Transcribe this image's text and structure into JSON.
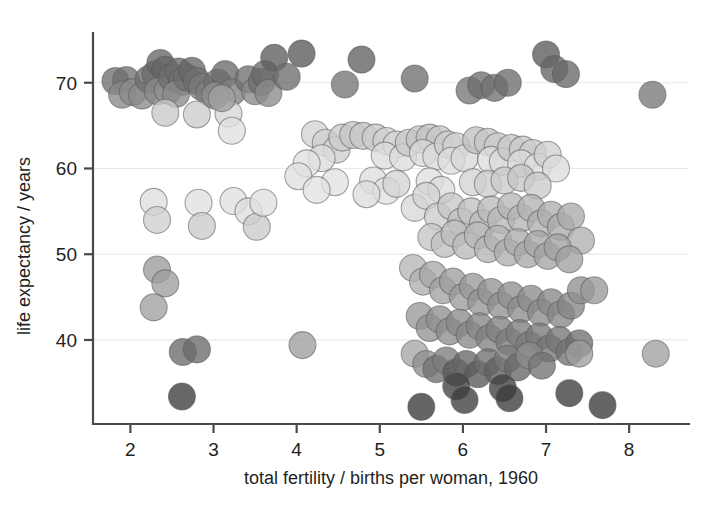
{
  "chart_data": {
    "type": "scatter",
    "title": "",
    "xlabel": "total fertility / births per woman, 1960",
    "ylabel": "life expectancy / years",
    "xlim": [
      1.55,
      8.72
    ],
    "ylim": [
      30.2,
      75.8
    ],
    "xticks": [
      2,
      3,
      4,
      5,
      6,
      7,
      8
    ],
    "xticklabels": [
      "2",
      "3",
      "4",
      "5",
      "6",
      "7",
      "8"
    ],
    "yticks": [
      40,
      50,
      60,
      70
    ],
    "yticklabels": [
      "40",
      "50",
      "60",
      "70"
    ],
    "grid": "horizontal",
    "legend": "none",
    "marker": {
      "shape": "circle",
      "diameter_px": 27,
      "opacity": 0.78,
      "edge_color": "#5a5a5a"
    },
    "encoding": {
      "x": "total fertility (births per woman), 1960",
      "y": "life expectancy (years)",
      "color": "grayscale shade per point (darker = higher income group)"
    },
    "shades": {
      "very_dark": "#3a3a3a",
      "dark": "#6b6b6b",
      "mid": "#9a9a9a",
      "light": "#c3c3c3",
      "very_light": "#e2e2e2"
    },
    "points": [
      {
        "x": 1.82,
        "y": 70.2,
        "c": "#6f6f6f"
      },
      {
        "x": 1.95,
        "y": 70.3,
        "c": "#6f6f6f"
      },
      {
        "x": 1.9,
        "y": 68.6,
        "c": "#888888"
      },
      {
        "x": 2.03,
        "y": 68.9,
        "c": "#8a8a8a"
      },
      {
        "x": 2.14,
        "y": 68.5,
        "c": "#8a8a8a"
      },
      {
        "x": 2.22,
        "y": 70.4,
        "c": "#6f6f6f"
      },
      {
        "x": 2.3,
        "y": 71.0,
        "c": "#6b6b6b"
      },
      {
        "x": 2.36,
        "y": 72.3,
        "c": "#666666"
      },
      {
        "x": 2.42,
        "y": 71.5,
        "c": "#666666"
      },
      {
        "x": 2.33,
        "y": 69.0,
        "c": "#888888"
      },
      {
        "x": 2.45,
        "y": 69.1,
        "c": "#8a8a8a"
      },
      {
        "x": 2.5,
        "y": 70.6,
        "c": "#6f6f6f"
      },
      {
        "x": 2.58,
        "y": 71.3,
        "c": "#6a6a6a"
      },
      {
        "x": 2.62,
        "y": 70.1,
        "c": "#6f6f6f"
      },
      {
        "x": 2.55,
        "y": 68.7,
        "c": "#8a8a8a"
      },
      {
        "x": 2.68,
        "y": 70.6,
        "c": "#6f6f6f"
      },
      {
        "x": 2.74,
        "y": 71.4,
        "c": "#676767"
      },
      {
        "x": 2.8,
        "y": 70.2,
        "c": "#6f6f6f"
      },
      {
        "x": 2.86,
        "y": 69.5,
        "c": "#7a7a7a"
      },
      {
        "x": 2.95,
        "y": 68.8,
        "c": "#7c7c7c"
      },
      {
        "x": 3.05,
        "y": 70.0,
        "c": "#6f6f6f"
      },
      {
        "x": 3.14,
        "y": 71.0,
        "c": "#6a6a6a"
      },
      {
        "x": 3.22,
        "y": 68.9,
        "c": "#828282"
      },
      {
        "x": 3.42,
        "y": 70.4,
        "c": "#6f6f6f"
      },
      {
        "x": 3.5,
        "y": 69.0,
        "c": "#898989"
      },
      {
        "x": 3.58,
        "y": 70.1,
        "c": "#6f6f6f"
      },
      {
        "x": 3.62,
        "y": 71.0,
        "c": "#6a6a6a"
      },
      {
        "x": 3.66,
        "y": 68.8,
        "c": "#8a8a8a"
      },
      {
        "x": 3.73,
        "y": 72.9,
        "c": "#5e5e5e"
      },
      {
        "x": 3.88,
        "y": 70.7,
        "c": "#6d6d6d"
      },
      {
        "x": 4.06,
        "y": 73.4,
        "c": "#5a5a5a"
      },
      {
        "x": 4.58,
        "y": 69.8,
        "c": "#747474"
      },
      {
        "x": 4.78,
        "y": 72.7,
        "c": "#616161"
      },
      {
        "x": 5.42,
        "y": 70.5,
        "c": "#6e6e6e"
      },
      {
        "x": 6.08,
        "y": 69.1,
        "c": "#767676"
      },
      {
        "x": 6.22,
        "y": 69.7,
        "c": "#6e6e6e"
      },
      {
        "x": 6.38,
        "y": 69.4,
        "c": "#717171"
      },
      {
        "x": 6.54,
        "y": 70.0,
        "c": "#6c6c6c"
      },
      {
        "x": 7.0,
        "y": 73.3,
        "c": "#5b5b5b"
      },
      {
        "x": 7.1,
        "y": 71.6,
        "c": "#646464"
      },
      {
        "x": 7.24,
        "y": 71.0,
        "c": "#686868"
      },
      {
        "x": 8.28,
        "y": 68.6,
        "c": "#787878"
      },
      {
        "x": 2.42,
        "y": 66.5,
        "c": "#c8c8c8"
      },
      {
        "x": 2.8,
        "y": 66.3,
        "c": "#cccccc"
      },
      {
        "x": 3.18,
        "y": 66.4,
        "c": "#d6d6d6"
      },
      {
        "x": 3.22,
        "y": 64.4,
        "c": "#e0e0e0"
      },
      {
        "x": 3.02,
        "y": 68.5,
        "c": "#909090"
      },
      {
        "x": 3.1,
        "y": 68.2,
        "c": "#a0a0a0"
      },
      {
        "x": 4.22,
        "y": 64.0,
        "c": "#d4d4d4"
      },
      {
        "x": 4.35,
        "y": 63.0,
        "c": "#cfcfcf"
      },
      {
        "x": 4.48,
        "y": 62.2,
        "c": "#cfcfcf"
      },
      {
        "x": 4.3,
        "y": 61.2,
        "c": "#dddddd"
      },
      {
        "x": 4.12,
        "y": 60.6,
        "c": "#e0e0e0"
      },
      {
        "x": 4.55,
        "y": 63.6,
        "c": "#cccccc"
      },
      {
        "x": 4.68,
        "y": 63.9,
        "c": "#c6c6c6"
      },
      {
        "x": 4.8,
        "y": 63.8,
        "c": "#c8c8c8"
      },
      {
        "x": 4.95,
        "y": 63.6,
        "c": "#cacaca"
      },
      {
        "x": 5.08,
        "y": 63.2,
        "c": "#cfcfcf"
      },
      {
        "x": 5.2,
        "y": 62.8,
        "c": "#d3d3d3"
      },
      {
        "x": 5.06,
        "y": 61.5,
        "c": "#dddddd"
      },
      {
        "x": 5.28,
        "y": 61.3,
        "c": "#dddddd"
      },
      {
        "x": 5.35,
        "y": 63.0,
        "c": "#c9c9c9"
      },
      {
        "x": 5.48,
        "y": 63.4,
        "c": "#c4c4c4"
      },
      {
        "x": 5.6,
        "y": 63.6,
        "c": "#c1c1c1"
      },
      {
        "x": 5.72,
        "y": 63.4,
        "c": "#c6c6c6"
      },
      {
        "x": 5.52,
        "y": 61.8,
        "c": "#d9d9d9"
      },
      {
        "x": 5.68,
        "y": 61.4,
        "c": "#dadada"
      },
      {
        "x": 5.82,
        "y": 62.8,
        "c": "#cdcdcd"
      },
      {
        "x": 5.92,
        "y": 62.6,
        "c": "#cfcfcf"
      },
      {
        "x": 5.86,
        "y": 60.9,
        "c": "#dedede"
      },
      {
        "x": 6.02,
        "y": 61.2,
        "c": "#d9d9d9"
      },
      {
        "x": 6.16,
        "y": 63.3,
        "c": "#c0c0c0"
      },
      {
        "x": 6.3,
        "y": 63.1,
        "c": "#c5c5c5"
      },
      {
        "x": 6.42,
        "y": 62.6,
        "c": "#cacaca"
      },
      {
        "x": 6.34,
        "y": 61.0,
        "c": "#dcdcdc"
      },
      {
        "x": 6.48,
        "y": 60.8,
        "c": "#dbdbdb"
      },
      {
        "x": 6.58,
        "y": 62.4,
        "c": "#c8c8c8"
      },
      {
        "x": 6.72,
        "y": 62.2,
        "c": "#c9c9c9"
      },
      {
        "x": 6.84,
        "y": 61.8,
        "c": "#cbcbcb"
      },
      {
        "x": 6.7,
        "y": 60.6,
        "c": "#dddddd"
      },
      {
        "x": 6.9,
        "y": 60.2,
        "c": "#dededeff"
      },
      {
        "x": 7.02,
        "y": 61.6,
        "c": "#cfcfcf"
      },
      {
        "x": 7.12,
        "y": 60.0,
        "c": "#dddddd"
      },
      {
        "x": 4.02,
        "y": 59.1,
        "c": "#e0e0e0"
      },
      {
        "x": 4.46,
        "y": 58.4,
        "c": "#e2e2e2"
      },
      {
        "x": 4.92,
        "y": 58.6,
        "c": "#dedede"
      },
      {
        "x": 5.08,
        "y": 57.4,
        "c": "#e0e0e0"
      },
      {
        "x": 5.2,
        "y": 58.2,
        "c": "#d4d4d4"
      },
      {
        "x": 5.6,
        "y": 58.5,
        "c": "#e0e0e0"
      },
      {
        "x": 5.74,
        "y": 57.5,
        "c": "#dcdcdc"
      },
      {
        "x": 6.12,
        "y": 58.4,
        "c": "#d3d3d3"
      },
      {
        "x": 6.3,
        "y": 58.2,
        "c": "#cdcdcd"
      },
      {
        "x": 6.5,
        "y": 58.6,
        "c": "#c9c9c9"
      },
      {
        "x": 6.7,
        "y": 58.9,
        "c": "#c5c5c5"
      },
      {
        "x": 6.9,
        "y": 58.0,
        "c": "#cacaca"
      },
      {
        "x": 2.28,
        "y": 56.1,
        "c": "#dedede"
      },
      {
        "x": 2.32,
        "y": 54.0,
        "c": "#d0d0d0"
      },
      {
        "x": 2.82,
        "y": 56.0,
        "c": "#e0e0e0"
      },
      {
        "x": 2.86,
        "y": 53.3,
        "c": "#cbcbcb"
      },
      {
        "x": 3.24,
        "y": 56.2,
        "c": "#e0e0e0"
      },
      {
        "x": 3.42,
        "y": 55.0,
        "c": "#dedede"
      },
      {
        "x": 3.52,
        "y": 53.2,
        "c": "#cacaca"
      },
      {
        "x": 3.6,
        "y": 56.0,
        "c": "#e0e0e0"
      },
      {
        "x": 4.24,
        "y": 57.5,
        "c": "#e2e2e2"
      },
      {
        "x": 4.84,
        "y": 57.0,
        "c": "#dcdcdc"
      },
      {
        "x": 5.42,
        "y": 55.4,
        "c": "#d8d8d8"
      },
      {
        "x": 5.56,
        "y": 56.8,
        "c": "#d4d4d4"
      },
      {
        "x": 5.7,
        "y": 54.4,
        "c": "#cccccc"
      },
      {
        "x": 5.86,
        "y": 55.6,
        "c": "#c7c7c7"
      },
      {
        "x": 5.98,
        "y": 53.8,
        "c": "#c2c2c2"
      },
      {
        "x": 6.1,
        "y": 55.0,
        "c": "#c0c0c0"
      },
      {
        "x": 6.24,
        "y": 53.6,
        "c": "#bdbdbd"
      },
      {
        "x": 6.34,
        "y": 55.2,
        "c": "#bababa"
      },
      {
        "x": 6.46,
        "y": 54.0,
        "c": "#b8b8b8"
      },
      {
        "x": 6.58,
        "y": 55.6,
        "c": "#b6b6b6"
      },
      {
        "x": 6.7,
        "y": 54.2,
        "c": "#b4b4b4"
      },
      {
        "x": 6.82,
        "y": 55.4,
        "c": "#b2b2b2"
      },
      {
        "x": 6.94,
        "y": 53.6,
        "c": "#b0b0b0"
      },
      {
        "x": 7.06,
        "y": 54.6,
        "c": "#adadad"
      },
      {
        "x": 7.18,
        "y": 53.2,
        "c": "#acacac"
      },
      {
        "x": 7.3,
        "y": 54.4,
        "c": "#aaaaaa"
      },
      {
        "x": 7.42,
        "y": 51.6,
        "c": "#b0b0b0"
      },
      {
        "x": 5.62,
        "y": 52.0,
        "c": "#c4c4c4"
      },
      {
        "x": 5.78,
        "y": 51.2,
        "c": "#c0c0c0"
      },
      {
        "x": 5.9,
        "y": 52.4,
        "c": "#bcbcbc"
      },
      {
        "x": 6.04,
        "y": 51.0,
        "c": "#bababa"
      },
      {
        "x": 6.18,
        "y": 52.2,
        "c": "#b7b7b7"
      },
      {
        "x": 6.3,
        "y": 50.6,
        "c": "#b4b4b4"
      },
      {
        "x": 6.42,
        "y": 51.8,
        "c": "#b2b2b2"
      },
      {
        "x": 6.54,
        "y": 50.2,
        "c": "#aeaeae"
      },
      {
        "x": 6.66,
        "y": 51.4,
        "c": "#acacac"
      },
      {
        "x": 6.78,
        "y": 50.0,
        "c": "#a8a8a8"
      },
      {
        "x": 6.9,
        "y": 51.2,
        "c": "#a6a6a6"
      },
      {
        "x": 7.02,
        "y": 49.8,
        "c": "#a4a4a4"
      },
      {
        "x": 7.14,
        "y": 50.8,
        "c": "#a2a2a2"
      },
      {
        "x": 7.28,
        "y": 49.4,
        "c": "#a0a0a0"
      },
      {
        "x": 2.32,
        "y": 48.2,
        "c": "#9b9b9b"
      },
      {
        "x": 2.42,
        "y": 46.6,
        "c": "#9e9e9e"
      },
      {
        "x": 2.28,
        "y": 43.8,
        "c": "#a0a0a0"
      },
      {
        "x": 5.4,
        "y": 48.4,
        "c": "#b6b6b6"
      },
      {
        "x": 5.52,
        "y": 46.8,
        "c": "#aeaeae"
      },
      {
        "x": 5.64,
        "y": 47.6,
        "c": "#a8a8a8"
      },
      {
        "x": 5.76,
        "y": 45.8,
        "c": "#a2a2a2"
      },
      {
        "x": 5.88,
        "y": 46.8,
        "c": "#9e9e9e"
      },
      {
        "x": 6.0,
        "y": 45.0,
        "c": "#9b9b9b"
      },
      {
        "x": 6.12,
        "y": 46.2,
        "c": "#989898"
      },
      {
        "x": 6.22,
        "y": 44.4,
        "c": "#959595"
      },
      {
        "x": 6.34,
        "y": 45.6,
        "c": "#939393"
      },
      {
        "x": 6.46,
        "y": 44.0,
        "c": "#919191"
      },
      {
        "x": 6.58,
        "y": 45.2,
        "c": "#8f8f8f"
      },
      {
        "x": 6.7,
        "y": 43.6,
        "c": "#8d8d8d"
      },
      {
        "x": 6.82,
        "y": 44.8,
        "c": "#8c8c8c"
      },
      {
        "x": 6.94,
        "y": 43.2,
        "c": "#8a8a8a"
      },
      {
        "x": 7.06,
        "y": 44.4,
        "c": "#888888"
      },
      {
        "x": 7.18,
        "y": 43.0,
        "c": "#878787"
      },
      {
        "x": 7.3,
        "y": 44.0,
        "c": "#858585"
      },
      {
        "x": 7.42,
        "y": 45.8,
        "c": "#8f8f8f"
      },
      {
        "x": 7.58,
        "y": 45.8,
        "c": "#999999"
      },
      {
        "x": 5.48,
        "y": 42.8,
        "c": "#999999"
      },
      {
        "x": 5.6,
        "y": 41.4,
        "c": "#949494"
      },
      {
        "x": 5.72,
        "y": 42.4,
        "c": "#909090"
      },
      {
        "x": 5.84,
        "y": 41.0,
        "c": "#8d8d8d"
      },
      {
        "x": 5.96,
        "y": 42.0,
        "c": "#8a8a8a"
      },
      {
        "x": 6.08,
        "y": 40.6,
        "c": "#888888"
      },
      {
        "x": 6.2,
        "y": 41.6,
        "c": "#858585"
      },
      {
        "x": 6.32,
        "y": 40.2,
        "c": "#828282"
      },
      {
        "x": 6.44,
        "y": 41.2,
        "c": "#808080"
      },
      {
        "x": 6.56,
        "y": 39.8,
        "c": "#7e7e7e"
      },
      {
        "x": 6.68,
        "y": 40.8,
        "c": "#7c7c7c"
      },
      {
        "x": 6.8,
        "y": 39.4,
        "c": "#7a7a7a"
      },
      {
        "x": 6.92,
        "y": 40.4,
        "c": "#787878"
      },
      {
        "x": 7.04,
        "y": 39.0,
        "c": "#767676"
      },
      {
        "x": 7.16,
        "y": 40.0,
        "c": "#747474"
      },
      {
        "x": 7.28,
        "y": 38.6,
        "c": "#727272"
      },
      {
        "x": 7.4,
        "y": 39.6,
        "c": "#707070"
      },
      {
        "x": 2.63,
        "y": 38.6,
        "c": "#6a6a6a"
      },
      {
        "x": 2.8,
        "y": 38.9,
        "c": "#6a6a6a"
      },
      {
        "x": 4.07,
        "y": 39.4,
        "c": "#9d9d9d"
      },
      {
        "x": 5.42,
        "y": 38.4,
        "c": "#a5a5a5"
      },
      {
        "x": 5.56,
        "y": 37.2,
        "c": "#8e8e8e"
      },
      {
        "x": 5.68,
        "y": 36.6,
        "c": "#6f6f6f"
      },
      {
        "x": 5.8,
        "y": 37.6,
        "c": "#7c7c7c"
      },
      {
        "x": 5.92,
        "y": 36.2,
        "c": "#5a5a5a"
      },
      {
        "x": 6.04,
        "y": 37.2,
        "c": "#666666"
      },
      {
        "x": 6.18,
        "y": 36.0,
        "c": "#585858"
      },
      {
        "x": 6.3,
        "y": 37.4,
        "c": "#6e6e6e"
      },
      {
        "x": 6.42,
        "y": 36.4,
        "c": "#606060"
      },
      {
        "x": 6.54,
        "y": 37.8,
        "c": "#7a7a7a"
      },
      {
        "x": 6.66,
        "y": 36.8,
        "c": "#666666"
      },
      {
        "x": 6.8,
        "y": 38.2,
        "c": "#8a8a8a"
      },
      {
        "x": 6.95,
        "y": 37.0,
        "c": "#727272"
      },
      {
        "x": 7.4,
        "y": 38.4,
        "c": "#9e9e9e"
      },
      {
        "x": 8.32,
        "y": 38.4,
        "c": "#a0a0a0"
      },
      {
        "x": 2.62,
        "y": 33.4,
        "c": "#3c3c3c"
      },
      {
        "x": 5.5,
        "y": 32.2,
        "c": "#3a3a3a"
      },
      {
        "x": 5.92,
        "y": 34.6,
        "c": "#404040"
      },
      {
        "x": 6.02,
        "y": 33.0,
        "c": "#3c3c3c"
      },
      {
        "x": 6.48,
        "y": 34.4,
        "c": "#3e3e3e"
      },
      {
        "x": 6.56,
        "y": 33.2,
        "c": "#3a3a3a"
      },
      {
        "x": 7.28,
        "y": 33.8,
        "c": "#3c3c3c"
      },
      {
        "x": 7.68,
        "y": 32.4,
        "c": "#3a3a3a"
      }
    ]
  }
}
